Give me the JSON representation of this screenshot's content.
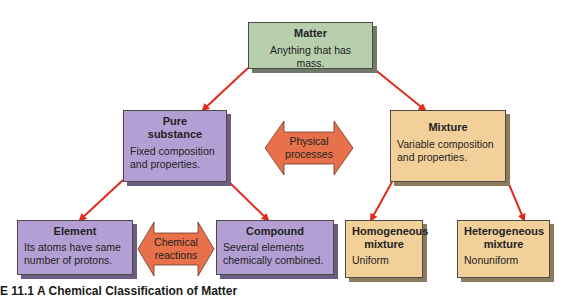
{
  "diagram": {
    "nodes": {
      "matter": {
        "title": "Matter",
        "desc": "Anything that has mass."
      },
      "pure_substance": {
        "title": "Pure substance",
        "desc": "Fixed composition and properties."
      },
      "mixture": {
        "title": "Mixture",
        "desc": "Variable composition and properties."
      },
      "element": {
        "title": "Element",
        "desc": "Its atoms have same number of protons."
      },
      "compound": {
        "title": "Compound",
        "desc": "Several elements chemically combined."
      },
      "homogeneous": {
        "title": "Homogeneous mixture",
        "desc": "Uniform"
      },
      "heterogeneous": {
        "title": "Heterogeneous mixture",
        "desc": "Nonuniform"
      }
    },
    "double_arrows": {
      "physical": {
        "label": "Physical processes"
      },
      "chemical": {
        "label": "Chemical reactions"
      }
    },
    "colors": {
      "matter": "#b7cfac",
      "substance": "#b39fd3",
      "mixture": "#f3cf9a",
      "arrow_fill": "#e8704a",
      "connector": "#e02a1c"
    }
  },
  "caption": "E 11.1  A Chemical Classification of Matter"
}
